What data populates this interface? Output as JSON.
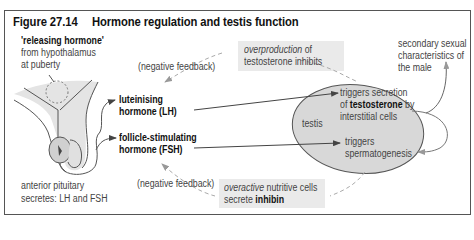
{
  "figure": {
    "number": "Figure 27.14",
    "title": "Hormone regulation and testis function"
  },
  "labels": {
    "releasing_hormone": "'releasing hormone'",
    "from_hypothalamus": "from hypothalamus",
    "at_puberty": "at puberty",
    "neg_feedback_top": "(negative feedback)",
    "neg_feedback_bottom": "(negative feedback)",
    "overproduction_italic": "overproduction",
    "overproduction_rest": " of",
    "testosterone_inhibits": "testosterone inhibits",
    "secondary_1": "secondary sexual",
    "secondary_2": "characteristics of",
    "secondary_3": "the male",
    "lh_1": "luteinising",
    "lh_2": "hormone (LH)",
    "fsh_1": "follicle-stimulating",
    "fsh_2": "hormone (FSH)",
    "testis": "testis",
    "triggers_secretion": "triggers secretion",
    "of": "of ",
    "testosterone": "testosterone",
    "by": " by",
    "interstitial_cells": "interstitial cells",
    "triggers": "triggers",
    "spermatogenesis": "spermatogenesis",
    "anterior_pituitary": "anterior pituitary",
    "secretes": "secretes: LH and FSH",
    "overactive_italic": "overactive",
    "nutritive_cells": " nutritive cells",
    "secrete": "secrete ",
    "inhibin": "inhibin"
  },
  "colors": {
    "shading": "#e6e6e6",
    "testis_fill": "#d9d9d9",
    "arrow": "#444444",
    "dashed": "#aaaaaa"
  }
}
